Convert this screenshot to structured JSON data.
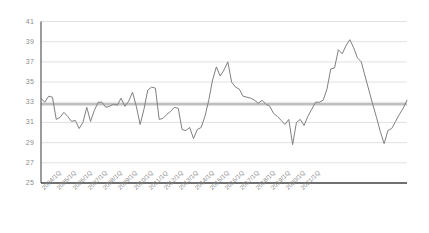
{
  "chart_data": {
    "type": "line",
    "title": "",
    "subtitle": "",
    "xlabel": "",
    "ylabel": "",
    "ylim": [
      25,
      41
    ],
    "ytick_step": 2,
    "ytick_labels": [
      "41",
      "39",
      "37",
      "35",
      "33",
      "31",
      "29",
      "27",
      "25"
    ],
    "grid": true,
    "grid_color": "#d9d9d9",
    "legend": "none",
    "line_color": "#808080",
    "reference_line": {
      "value": 32.8,
      "color": "#bfbfbf",
      "label": ""
    },
    "xtick_labels": [
      "2004/1Q",
      "2005/1Q",
      "2006/1Q",
      "2007/1Q",
      "2008/1Q",
      "2009/1Q",
      "2010/1Q",
      "2011/1Q",
      "2012/1Q",
      "2013/1Q",
      "2014/1Q",
      "2015/1Q",
      "2016/1Q",
      "2017/1Q",
      "2018/1Q",
      "2019/1Q",
      "2020/1Q",
      "2021/1Q"
    ],
    "x_period": "quarterly",
    "x_start": "2004/1Q",
    "x_end": "2021/4Q",
    "series": [
      {
        "name": "series-1",
        "values": [
          33.4,
          33.0,
          33.6,
          33.5,
          31.3,
          31.5,
          32.0,
          31.6,
          31.1,
          31.2,
          30.4,
          31.0,
          32.5,
          31.1,
          32.2,
          33.0,
          33.0,
          32.5,
          32.6,
          32.8,
          32.7,
          33.4,
          32.6,
          33.1,
          34.0,
          32.6,
          30.8,
          32.3,
          34.2,
          34.5,
          34.4,
          31.3,
          31.4,
          31.8,
          32.1,
          32.5,
          32.4,
          30.3,
          30.2,
          30.5,
          29.4,
          30.3,
          30.5,
          31.6,
          33.2,
          35.2,
          36.5,
          35.6,
          36.2,
          37.0,
          35.0,
          34.5,
          34.3,
          33.6,
          33.5,
          33.4,
          33.2,
          32.9,
          33.2,
          32.8,
          32.6,
          31.9,
          31.6,
          31.2,
          30.8,
          31.3,
          28.8,
          31.0,
          31.3,
          30.7,
          31.6,
          32.3,
          33.0,
          33.0,
          33.2,
          34.3,
          36.3,
          36.4,
          38.2,
          37.8,
          38.6,
          39.2,
          38.4,
          37.4,
          37.0,
          35.6,
          34.2,
          32.8,
          31.5,
          30.1,
          28.9,
          30.2,
          30.4,
          31.1,
          31.8,
          32.4,
          33.2
        ]
      }
    ]
  }
}
